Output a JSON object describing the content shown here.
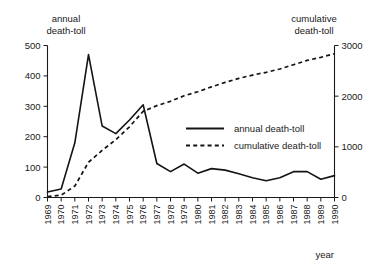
{
  "chart_data": {
    "type": "line",
    "title": "",
    "xlabel": "year",
    "left_axis_label_line1": "annual",
    "left_axis_label_line2": "death-toll",
    "right_axis_label_line1": "cumulative",
    "right_axis_label_line2": "death-toll",
    "grid": false,
    "legend_position": "center-right",
    "x": [
      1969,
      1970,
      1971,
      1972,
      1973,
      1974,
      1975,
      1976,
      1977,
      1978,
      1979,
      1980,
      1981,
      1982,
      1983,
      1984,
      1985,
      1986,
      1987,
      1988,
      1989,
      1990
    ],
    "xtick_labels": [
      "1969",
      "1970",
      "1971",
      "1972",
      "1973",
      "1974",
      "1975",
      "1976",
      "1977",
      "1978",
      "1979",
      "1980",
      "1981",
      "1982",
      "1983",
      "1984",
      "1985",
      "1986",
      "1987",
      "1988",
      "1989",
      "1990"
    ],
    "left_ylim": [
      0,
      500
    ],
    "left_yticks": [
      0,
      100,
      200,
      300,
      400,
      500
    ],
    "left_ytick_labels": [
      "0",
      "100",
      "200",
      "300",
      "400",
      "500"
    ],
    "right_ylim": [
      0,
      3000
    ],
    "right_yticks": [
      0,
      1000,
      2000,
      3000
    ],
    "right_ytick_labels": [
      "0",
      "1000",
      "2000",
      "3000"
    ],
    "series": [
      {
        "name": "annual death-toll",
        "axis": "left",
        "style": "solid",
        "color": "#141414",
        "values": [
          18,
          28,
          180,
          470,
          235,
          210,
          255,
          305,
          112,
          85,
          110,
          80,
          95,
          90,
          78,
          65,
          55,
          65,
          85,
          85,
          60,
          72
        ]
      },
      {
        "name": "cumulative death-toll",
        "axis": "right",
        "style": "dashed",
        "color": "#141414",
        "values": [
          18,
          46,
          226,
          696,
          931,
          1141,
          1396,
          1701,
          1813,
          1898,
          2008,
          2088,
          2183,
          2273,
          2351,
          2416,
          2471,
          2536,
          2621,
          2706,
          2766,
          2838
        ]
      }
    ],
    "legend": [
      {
        "label": "annual death-toll",
        "style": "solid"
      },
      {
        "label": "cumulative death-toll",
        "style": "dashed"
      }
    ]
  }
}
